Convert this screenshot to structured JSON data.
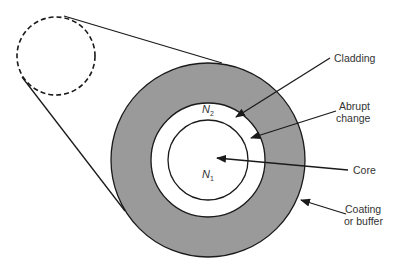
{
  "diagram": {
    "labels": {
      "cladding": "Cladding",
      "abrupt_change_line1": "Abrupt",
      "abrupt_change_line2": "change",
      "core": "Core",
      "coating_line1": "Coating",
      "coating_line2": "or buffer"
    },
    "symbols": {
      "n2": "N",
      "n2_sub": "2",
      "n1": "N",
      "n1_sub": "1"
    },
    "colors": {
      "coating_fill": "#9a9a9a",
      "stroke": "#1a1a1a",
      "background": "#ffffff"
    }
  }
}
